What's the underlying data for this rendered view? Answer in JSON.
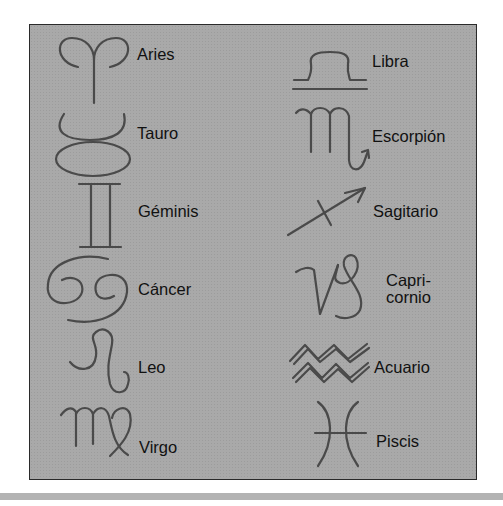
{
  "colors": {
    "panel_bg": "#a9a9a9",
    "glyph_stroke": "#4a4a4a",
    "text": "#111111",
    "border": "#2a2a2a"
  },
  "signs": {
    "left": [
      {
        "name": "Aries",
        "icon": "aries-icon"
      },
      {
        "name": "Tauro",
        "icon": "taurus-icon"
      },
      {
        "name": "Géminis",
        "icon": "gemini-icon"
      },
      {
        "name": "Cáncer",
        "icon": "cancer-icon"
      },
      {
        "name": "Leo",
        "icon": "leo-icon"
      },
      {
        "name": "Virgo",
        "icon": "virgo-icon"
      }
    ],
    "right": [
      {
        "name": "Libra",
        "icon": "libra-icon"
      },
      {
        "name": "Escorpión",
        "icon": "scorpio-icon"
      },
      {
        "name": "Sagitario",
        "icon": "sagittarius-icon"
      },
      {
        "name": "Capri-",
        "name_line2": "cornio",
        "icon": "capricorn-icon"
      },
      {
        "name": "Acuario",
        "icon": "aquarius-icon"
      },
      {
        "name": "Piscis",
        "icon": "pisces-icon"
      }
    ]
  }
}
